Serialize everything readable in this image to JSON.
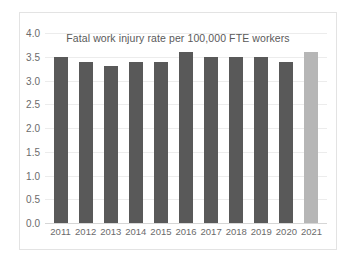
{
  "chart_data": {
    "type": "bar",
    "title": "Fatal work injury rate per 100,000 FTE workers",
    "xlabel": "",
    "ylabel": "",
    "categories": [
      "2011",
      "2012",
      "2013",
      "2014",
      "2015",
      "2016",
      "2017",
      "2018",
      "2019",
      "2020",
      "2021"
    ],
    "values": [
      3.5,
      3.4,
      3.3,
      3.4,
      3.4,
      3.6,
      3.5,
      3.5,
      3.5,
      3.4,
      3.6
    ],
    "ylim": [
      0.0,
      4.0
    ],
    "ytick_labels": [
      "4.0",
      "3.5",
      "3.0",
      "2.5",
      "2.0",
      "1.5",
      "1.0",
      "0.5",
      "0.0"
    ],
    "ytick_values": [
      4.0,
      3.5,
      3.0,
      2.5,
      2.0,
      1.5,
      1.0,
      0.5,
      0.0
    ],
    "grid": true,
    "legend": false,
    "bar_color": "#595959",
    "highlight_color": "#b6b6b6",
    "highlight_category": "2021",
    "grid_color": "#ececec",
    "axis_color": "#d6d6d6",
    "text_color": "#6b6b6b",
    "background": "#ffffff",
    "border_color": "#e3e3e3"
  }
}
